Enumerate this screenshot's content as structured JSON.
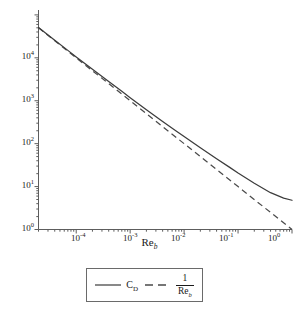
{
  "chart_data": {
    "type": "line",
    "title": "",
    "xlabel": "Re_b",
    "ylabel": "",
    "xscale": "log",
    "yscale": "log",
    "xlim": [
      2e-05,
      1.0
    ],
    "ylim": [
      1.0,
      130000
    ],
    "grid": false,
    "legend_position": "below-axes",
    "xticks": [
      0.0001,
      0.001,
      0.01,
      0.1,
      1
    ],
    "xtick_labels": [
      "10-4",
      "10-3",
      "10-2",
      "10-1",
      "100"
    ],
    "yticks": [
      1,
      10,
      100,
      1000,
      10000
    ],
    "ytick_labels": [
      "100",
      "101",
      "102",
      "103",
      "104"
    ],
    "series": [
      {
        "name": "C_D",
        "style": "solid",
        "color": "#3c3c3c",
        "x": [
          2e-05,
          4e-05,
          7e-05,
          0.0001,
          0.0002,
          0.0004,
          0.0007,
          0.001,
          0.002,
          0.004,
          0.007,
          0.01,
          0.02,
          0.04,
          0.07,
          0.1,
          0.2,
          0.4,
          0.7,
          1.0
        ],
        "y": [
          51000,
          25800,
          14900,
          10500,
          5400,
          2800,
          1660,
          1180,
          620,
          330,
          200,
          146,
          80.0,
          44.5,
          28.0,
          20.8,
          12.0,
          7.2,
          5.4,
          4.8
        ]
      },
      {
        "name": "1/Re_b",
        "style": "dashed",
        "color": "#4a4a4a",
        "x": [
          2e-05,
          0.0001,
          0.001,
          0.01,
          0.1,
          1.0
        ],
        "y": [
          50000,
          10000,
          1000,
          100,
          10,
          1
        ]
      }
    ]
  },
  "axis": {
    "x_title_main": "Re",
    "x_title_sub": "b"
  },
  "xtick_labels": [
    {
      "base": "10",
      "exp": "-4"
    },
    {
      "base": "10",
      "exp": "-3"
    },
    {
      "base": "10",
      "exp": "-2"
    },
    {
      "base": "10",
      "exp": "-1"
    },
    {
      "base": "10",
      "exp": "0"
    }
  ],
  "ytick_labels": [
    {
      "base": "10",
      "exp": "4"
    },
    {
      "base": "10",
      "exp": "3"
    },
    {
      "base": "10",
      "exp": "2"
    },
    {
      "base": "10",
      "exp": "1"
    },
    {
      "base": "10",
      "exp": "0"
    }
  ],
  "legend": {
    "entries": [
      {
        "label_main": "C",
        "label_sub": "D",
        "style": "solid"
      },
      {
        "numerator": "1",
        "denominator_main": "Re",
        "denominator_sub": "b",
        "style": "dashed"
      }
    ]
  }
}
